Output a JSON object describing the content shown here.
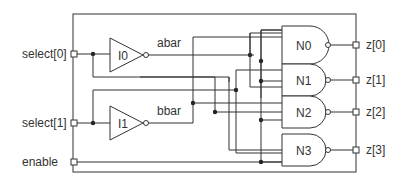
{
  "diagram": {
    "inputs": [
      {
        "id": "select0",
        "label": "select[0]"
      },
      {
        "id": "select1",
        "label": "select[1]"
      },
      {
        "id": "enable",
        "label": "enable"
      }
    ],
    "outputs": [
      {
        "id": "z0",
        "label": "z[0]"
      },
      {
        "id": "z1",
        "label": "z[1]"
      },
      {
        "id": "z2",
        "label": "z[2]"
      },
      {
        "id": "z3",
        "label": "z[3]"
      }
    ],
    "inverters": [
      {
        "id": "I0",
        "label": "I0",
        "output_net": "abar"
      },
      {
        "id": "I1",
        "label": "I1",
        "output_net": "bbar"
      }
    ],
    "nands": [
      {
        "id": "N0",
        "label": "N0",
        "output": "z[0]"
      },
      {
        "id": "N1",
        "label": "N1",
        "output": "z[1]"
      },
      {
        "id": "N2",
        "label": "N2",
        "output": "z[2]"
      },
      {
        "id": "N3",
        "label": "N3",
        "output": "z[3]"
      }
    ],
    "nets": {
      "abar": "abar",
      "bbar": "bbar"
    },
    "colors": {
      "stroke": "#333333",
      "background": "#ffffff"
    }
  }
}
